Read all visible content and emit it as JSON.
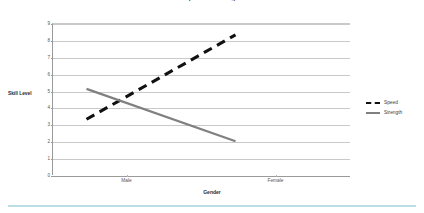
{
  "chart_data": {
    "type": "line",
    "title": "Gender Speed & Strength Profile",
    "xlabel": "Gender",
    "ylabel": "Skill Level",
    "categories": [
      "Male",
      "Female"
    ],
    "ylim": [
      0,
      9
    ],
    "yticks": [
      "9",
      "8",
      "7",
      "6",
      "5",
      "4",
      "3",
      "2",
      "1",
      "0"
    ],
    "grid": true,
    "legend_position": "right",
    "series": [
      {
        "name": "Speed",
        "values": [
          3.3,
          8.3
        ],
        "color": "#111111",
        "style": "dashed"
      },
      {
        "name": "Strength",
        "values": [
          5.1,
          2.0
        ],
        "color": "#808080",
        "style": "solid"
      }
    ]
  },
  "legend": {
    "items": [
      {
        "label": "Speed"
      },
      {
        "label": "Strength"
      }
    ]
  },
  "colors": {
    "speed": "#111111",
    "strength": "#808080",
    "grid": "#c9c9c9",
    "axis": "#9a9a9a",
    "accent_bar": "#bcdde4"
  }
}
